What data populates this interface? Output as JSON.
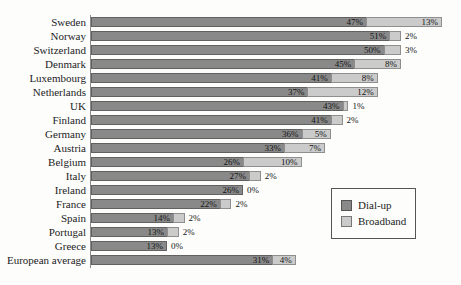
{
  "chart_data": {
    "type": "bar",
    "orientation": "horizontal",
    "stacked": true,
    "title": "",
    "xlabel": "",
    "ylabel": "",
    "grid": false,
    "xlim": [
      0,
      60
    ],
    "value_label_format": "percent",
    "legend_position": "middle-right",
    "categories": [
      "Sweden",
      "Norway",
      "Switzerland",
      "Denmark",
      "Luxembourg",
      "Netherlands",
      "UK",
      "Finland",
      "Germany",
      "Austria",
      "Belgium",
      "Italy",
      "Ireland",
      "France",
      "Spain",
      "Portugal",
      "Greece",
      "European average"
    ],
    "series": [
      {
        "name": "Dial-up",
        "color": "#898989",
        "values": [
          47,
          51,
          50,
          45,
          41,
          37,
          43,
          41,
          36,
          33,
          26,
          27,
          26,
          22,
          14,
          13,
          13,
          31
        ]
      },
      {
        "name": "Broadband",
        "color": "#cbcbcb",
        "values": [
          13,
          2,
          3,
          8,
          8,
          12,
          1,
          2,
          5,
          7,
          10,
          2,
          0,
          2,
          2,
          2,
          0,
          4
        ]
      }
    ]
  },
  "legend": {
    "items": [
      {
        "label": "Dial-up",
        "color": "#898989"
      },
      {
        "label": "Broadband",
        "color": "#cbcbcb"
      }
    ]
  }
}
